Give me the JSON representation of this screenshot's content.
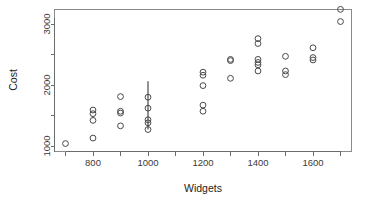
{
  "chart_data": {
    "type": "scatter",
    "title": "",
    "xlabel": "Widgets",
    "ylabel": "Cost",
    "xlim": [
      680,
      1730
    ],
    "ylim": [
      900,
      3320
    ],
    "grid": false,
    "legend": null,
    "x_ticks": [
      800,
      1000,
      1200,
      1400,
      1600
    ],
    "x_tick_labels": [
      "800",
      "1000",
      "1200",
      "1400",
      "1600"
    ],
    "x_minor_ticks": [
      700,
      900,
      1100,
      1300,
      1500,
      1700
    ],
    "y_ticks": [
      1000,
      2000,
      3000
    ],
    "y_tick_labels": [
      "1000",
      "2000",
      "3000"
    ],
    "y_minor_ticks": [
      1500,
      2500
    ],
    "marker": "open-circle",
    "marker_color": "#4a4a4a",
    "points": [
      {
        "x": 700,
        "y": 1040
      },
      {
        "x": 800,
        "y": 1130
      },
      {
        "x": 800,
        "y": 1420
      },
      {
        "x": 800,
        "y": 1530
      },
      {
        "x": 800,
        "y": 1590
      },
      {
        "x": 900,
        "y": 1330
      },
      {
        "x": 900,
        "y": 1540
      },
      {
        "x": 900,
        "y": 1570
      },
      {
        "x": 900,
        "y": 1810
      },
      {
        "x": 1000,
        "y": 1270
      },
      {
        "x": 1000,
        "y": 1380
      },
      {
        "x": 1000,
        "y": 1430
      },
      {
        "x": 1000,
        "y": 1620
      },
      {
        "x": 1000,
        "y": 1800
      },
      {
        "x": 1200,
        "y": 1570
      },
      {
        "x": 1200,
        "y": 1670
      },
      {
        "x": 1200,
        "y": 1990
      },
      {
        "x": 1200,
        "y": 2160
      },
      {
        "x": 1200,
        "y": 2210
      },
      {
        "x": 1300,
        "y": 2110
      },
      {
        "x": 1300,
        "y": 2400
      },
      {
        "x": 1300,
        "y": 2420
      },
      {
        "x": 1400,
        "y": 2230
      },
      {
        "x": 1400,
        "y": 2330
      },
      {
        "x": 1400,
        "y": 2370
      },
      {
        "x": 1400,
        "y": 2420
      },
      {
        "x": 1400,
        "y": 2680
      },
      {
        "x": 1400,
        "y": 2760
      },
      {
        "x": 1500,
        "y": 2170
      },
      {
        "x": 1500,
        "y": 2230
      },
      {
        "x": 1500,
        "y": 2470
      },
      {
        "x": 1600,
        "y": 2410
      },
      {
        "x": 1600,
        "y": 2450
      },
      {
        "x": 1600,
        "y": 2610
      },
      {
        "x": 1700,
        "y": 3040
      },
      {
        "x": 1700,
        "y": 3240
      }
    ],
    "error_bars": [
      {
        "x": 1000,
        "low": 1270,
        "high": 2060
      }
    ]
  }
}
